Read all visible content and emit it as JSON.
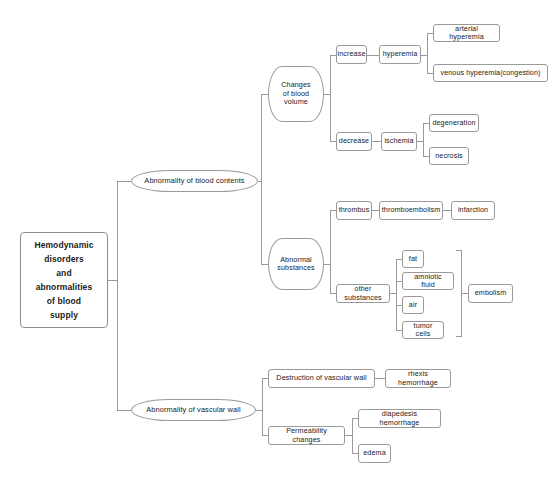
{
  "diagram": {
    "type": "mind-map",
    "title": "Hemodynamic disorders and abnormalities of blood supply",
    "line_color": "#9a9a9a",
    "node_border_color": "#9a9a9a",
    "background_color": "#ffffff",
    "text_color": "#1b1b1b",
    "root": {
      "id": "root",
      "label": "Hemodynamic\ndisorders\nand\nabnormalities\nof blood\nsupply",
      "lines": [
        "Hemodynamic",
        "disorders",
        "and",
        "abnormalities",
        "of blood",
        "supply"
      ]
    },
    "branch_blood_contents": {
      "label": "Abnormality of blood contents",
      "changes_of_blood_volume": {
        "label": "Changes\nof blood\nvolume",
        "lines": [
          "Changes",
          "of blood",
          "volume"
        ],
        "increase": {
          "label": "increase",
          "hyperemia": {
            "label": "hyperemia",
            "children": [
              "arterial hyperemia",
              "venous hyperemia(congestion)"
            ]
          }
        },
        "decrease": {
          "label": "decrease",
          "ischemia": {
            "label": "ischemia",
            "children": [
              "degeneration",
              "necrosis"
            ]
          }
        }
      },
      "abnormal_substances": {
        "label": "Abnormal\nsubstances",
        "lines": [
          "Abnormal",
          "substances"
        ],
        "thrombus_chain": [
          "thrombus",
          "thromboembolism",
          "infarction"
        ],
        "other_substances": {
          "label": "other substances",
          "children": [
            "fat",
            "amniotic fluid",
            "air",
            "tumor cells"
          ],
          "result": "embolism"
        }
      }
    },
    "branch_vascular_wall": {
      "label": "Abnormality of vascular wall",
      "destruction": {
        "label": "Destruction of vascular wall",
        "children": [
          "rhexis hemorrhage"
        ]
      },
      "permeability": {
        "label": "Permeability changes",
        "children": [
          "diapedesis hemorrhage",
          "edema"
        ]
      }
    }
  }
}
